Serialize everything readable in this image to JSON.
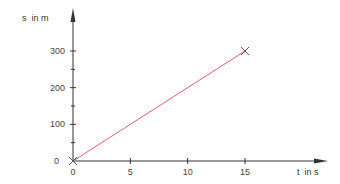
{
  "chart_data": {
    "type": "line",
    "title": "",
    "xlabel": "t  in s",
    "ylabel": "s  in m",
    "xlim": [
      0,
      15
    ],
    "ylim": [
      0,
      300
    ],
    "x_ticks": [
      0,
      5,
      10,
      15
    ],
    "x_tick_labels": [
      "0",
      "5",
      "10",
      "15"
    ],
    "y_ticks": [
      0,
      100,
      200,
      300
    ],
    "y_tick_labels": [
      "0",
      "100",
      "200",
      "300"
    ],
    "y_minor_ticks": [
      50,
      150,
      250
    ],
    "grid": false,
    "legend": null,
    "series": [
      {
        "name": "s(t)",
        "x": [
          0,
          15
        ],
        "y": [
          0,
          300
        ],
        "color": "#e0606a"
      }
    ],
    "markers": [
      {
        "x": 0,
        "y": 0,
        "shape": "x"
      },
      {
        "x": 15,
        "y": 300,
        "shape": "x"
      }
    ]
  },
  "colors": {
    "axis": "#333333",
    "line": "#e0606a",
    "marker": "#555555"
  }
}
